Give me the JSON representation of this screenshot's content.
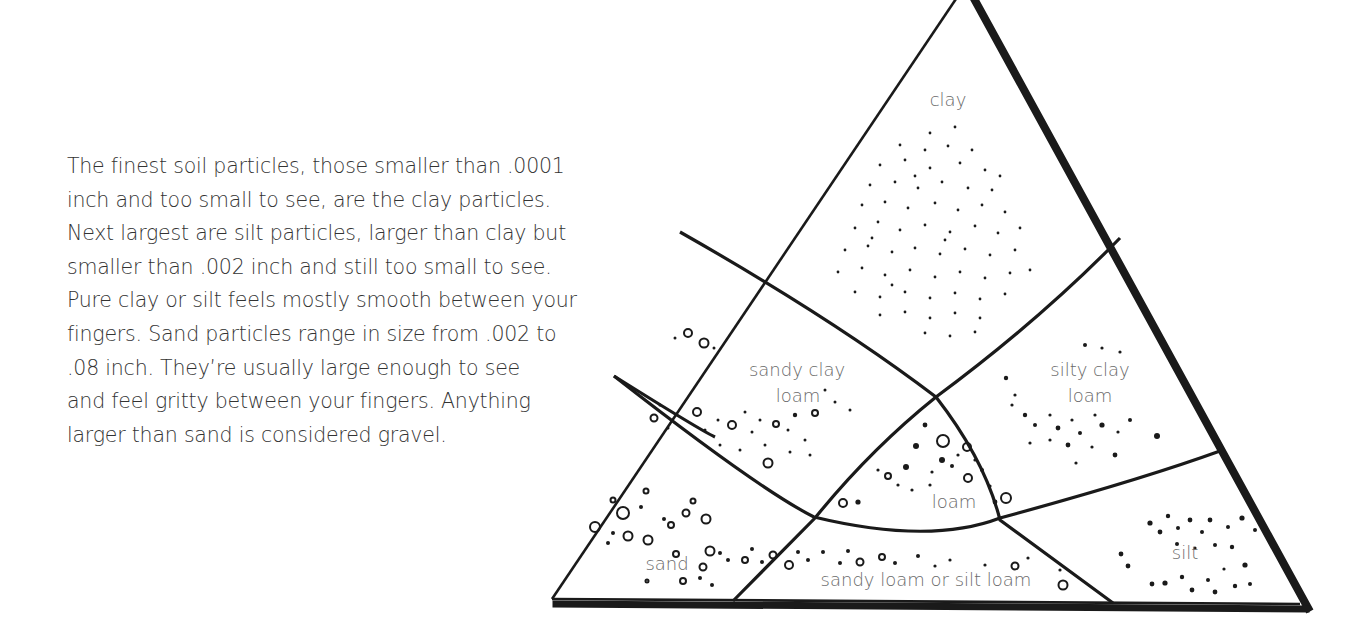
{
  "body_text": {
    "lines": [
      "The finest soil particles, those smaller than .0001",
      "inch and too small to see, are the clay particles.",
      "Next largest are silt particles, larger than clay but",
      "smaller than .002 inch and still too small to see.",
      "Pure clay or silt feels mostly smooth between your",
      "fingers. Sand particles range in size from .002 to",
      ".08 inch. They’re usually large enough to see",
      "and feel gritty between your fingers. Anything",
      "larger than sand is considered gravel."
    ]
  },
  "diagram": {
    "regions": {
      "clay": "clay",
      "sandy_clay_loam_1": "sandy clay",
      "sandy_clay_loam_2": "loam",
      "silty_clay_loam_1": "silty clay",
      "silty_clay_loam_2": "loam",
      "loam": "loam",
      "sand": "sand",
      "sandy_loam_or_silt_loam": "sandy loam or silt loam",
      "silt": "silt"
    },
    "colors": {
      "ink": "#1a1a1a",
      "label": "#6a6a6a",
      "text": "#333333"
    }
  }
}
